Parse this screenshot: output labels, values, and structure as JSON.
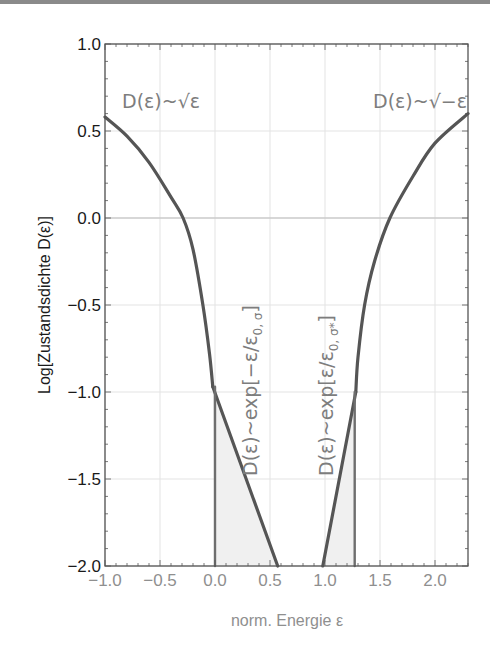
{
  "chart_data": {
    "type": "line",
    "title": "",
    "xlabel": "norm. Energie ε",
    "ylabel": "Log[Zustandsdichte D(ε)]",
    "xlim": [
      -1.0,
      2.3
    ],
    "ylim": [
      -2.0,
      1.0
    ],
    "x_ticks": [
      "−1.0",
      "−0.5",
      "0.0",
      "0.5",
      "1.0",
      "1.5",
      "2.0"
    ],
    "x_tick_values": [
      -1.0,
      -0.5,
      0.0,
      0.5,
      1.0,
      1.5,
      2.0
    ],
    "y_ticks": [
      "1.0",
      "0.5",
      "0.0",
      "−0.5",
      "−1.0",
      "−1.5",
      "−2.0"
    ],
    "y_tick_values": [
      1.0,
      0.5,
      0.0,
      -0.5,
      -1.0,
      -1.5,
      -2.0
    ],
    "grid": true,
    "zero_line": true,
    "series": [
      {
        "name": "valence band edge (sqrt)",
        "label": "D(ε)~√ε",
        "x": [
          -1.0,
          -0.8,
          -0.6,
          -0.4,
          -0.29,
          -0.2,
          -0.11,
          -0.05,
          -0.02
        ],
        "y": [
          0.58,
          0.47,
          0.32,
          0.12,
          0.0,
          -0.18,
          -0.5,
          -0.78,
          -0.97
        ]
      },
      {
        "name": "conduction band edge (sqrt)",
        "label": "D(ε)~√−ε",
        "x": [
          1.28,
          1.3,
          1.36,
          1.45,
          1.59,
          1.8,
          2.0,
          2.3
        ],
        "y": [
          -1.0,
          -0.8,
          -0.5,
          -0.25,
          0.0,
          0.24,
          0.43,
          0.6
        ]
      },
      {
        "name": "exponential tail (left)",
        "label": "D(ε)~exp[−ε/ε0,σ]",
        "x": [
          -0.02,
          0.57
        ],
        "y": [
          -0.97,
          -2.0
        ]
      },
      {
        "name": "exponential tail (right)",
        "label": "D(ε)~exp[ε/ε0,σ*]",
        "x": [
          0.98,
          1.28
        ],
        "y": [
          -2.0,
          -1.0
        ]
      },
      {
        "name": "left cutoff",
        "x": [
          0.0,
          0.0
        ],
        "y": [
          -0.97,
          -2.0
        ]
      },
      {
        "name": "right cutoff",
        "x": [
          1.27,
          1.27
        ],
        "y": [
          -1.0,
          -2.0
        ]
      }
    ],
    "shaded_regions": [
      {
        "name": "left tail area",
        "polygon_x": [
          0.0,
          -0.02,
          0.57,
          0.0
        ],
        "polygon_y": [
          -2.0,
          -0.97,
          -2.0,
          -2.0
        ]
      },
      {
        "name": "right tail area",
        "polygon_x": [
          0.98,
          1.28,
          1.27,
          0.98
        ],
        "polygon_y": [
          -2.0,
          -1.0,
          -2.0,
          -2.0
        ]
      }
    ],
    "annotations": [
      {
        "text": "D(ε)~√ε",
        "x": -0.92,
        "y": 0.62,
        "rotation": 0
      },
      {
        "text": "D(ε)~√−ε",
        "x": 1.36,
        "y": 0.62,
        "rotation": 0
      },
      {
        "text": "D(ε)~exp[−ε/ε0,σ]",
        "x": 0.22,
        "y": -0.55,
        "rotation": -90
      },
      {
        "text": "D(ε)~exp[ε/ε0,σ*]",
        "x": 1.0,
        "y": -0.55,
        "rotation": -90
      }
    ]
  },
  "labels": {
    "xlabel": "norm. Energie ε",
    "ylabel": "Log[Zustandsdichte D(ε)]",
    "annot_sqrt_left": "D(ε)~√ε",
    "annot_sqrt_right": "D(ε)~√−ε",
    "annot_exp_left": "D(ε)~exp[−ε/ε",
    "annot_exp_left_sub": "0, σ",
    "annot_exp_right": "D(ε)~exp[ε/ε",
    "annot_exp_right_sub": "0, σ*",
    "bracket_close": "]"
  },
  "colors": {
    "curve": "#555555",
    "grid": "#e3e3e3",
    "frame": "#555555",
    "shade": "#f0f0f0",
    "annotation": "#7d7d7d"
  }
}
